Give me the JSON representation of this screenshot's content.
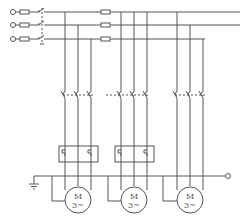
{
  "diagram": {
    "title": "",
    "type": "three-phase multi-motor control circuit",
    "supply_phases": 3,
    "motors": [
      {
        "id": "motor-1",
        "label": "M",
        "sublabel": "3~"
      },
      {
        "id": "motor-2",
        "label": "M",
        "sublabel": "3~"
      },
      {
        "id": "motor-3",
        "label": "M",
        "sublabel": "3~"
      }
    ],
    "components": [
      "input terminals",
      "fuses",
      "main switch",
      "branch fuses",
      "contactors",
      "thermal overload relays",
      "motors",
      "ground"
    ]
  }
}
